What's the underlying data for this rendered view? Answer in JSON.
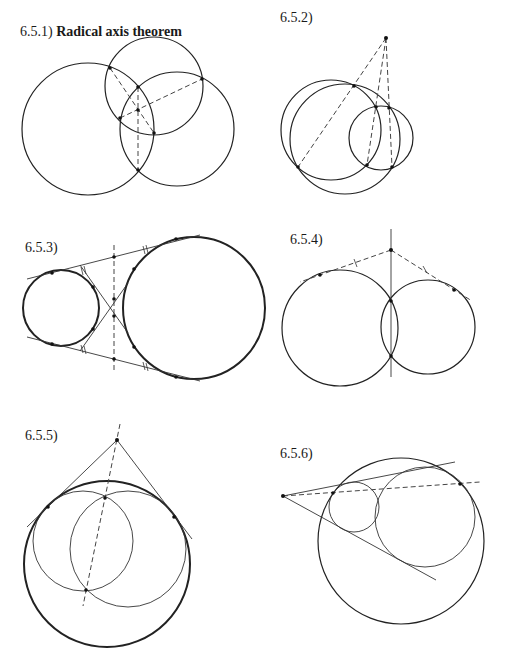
{
  "figures": [
    {
      "id": "6.5.1",
      "number": "6.5.1)",
      "title": "Radical axis theorem"
    },
    {
      "id": "6.5.2",
      "number": "6.5.2)",
      "title": ""
    },
    {
      "id": "6.5.3",
      "number": "6.5.3)",
      "title": ""
    },
    {
      "id": "6.5.4",
      "number": "6.5.4)",
      "title": ""
    },
    {
      "id": "6.5.5",
      "number": "6.5.5)",
      "title": ""
    },
    {
      "id": "6.5.6",
      "number": "6.5.6)",
      "title": ""
    }
  ],
  "colors": {
    "ink": "#222222",
    "background": "#ffffff"
  }
}
